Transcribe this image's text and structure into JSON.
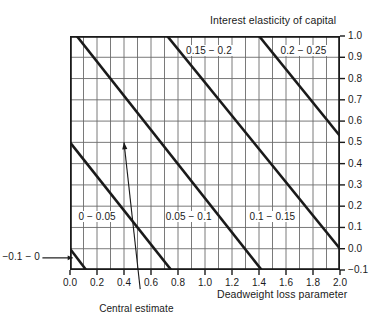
{
  "chart_data": {
    "type": "line",
    "title": "Interest elasticity of capital",
    "xlabel": "Deadweight loss parameter",
    "ylabel": "",
    "xlim": [
      0.0,
      2.0
    ],
    "ylim": [
      -0.1,
      1.0
    ],
    "grid": true,
    "grid_x_step": 0.1,
    "grid_y_step": 0.1,
    "x_ticks": [
      "0.0",
      "0.2",
      "0.4",
      "0.6",
      "0.8",
      "1.0",
      "1.2",
      "1.4",
      "1.6",
      "1.8",
      "2.0"
    ],
    "x_tick_values": [
      0.0,
      0.2,
      0.4,
      0.6,
      0.8,
      1.0,
      1.2,
      1.4,
      1.6,
      1.8,
      2.0
    ],
    "y_ticks": [
      "1.0",
      "0.9",
      "0.8",
      "0.7",
      "0.6",
      "0.5",
      "0.4",
      "0.3",
      "0.2",
      "0.1",
      "0.0",
      "-0.1"
    ],
    "y_tick_values": [
      1.0,
      0.9,
      0.8,
      0.7,
      0.6,
      0.5,
      0.4,
      0.3,
      0.2,
      0.1,
      0.0,
      -0.1
    ],
    "y_axis_position": "right",
    "series": [
      {
        "name": "boundary -0.1 / 0",
        "points": [
          [
            0.0,
            0.0
          ],
          [
            0.12,
            -0.1
          ]
        ]
      },
      {
        "name": "boundary 0 / 0.05",
        "points": [
          [
            0.0,
            0.5
          ],
          [
            0.75,
            -0.1
          ]
        ]
      },
      {
        "name": "boundary 0.05 / 0.1",
        "points": [
          [
            0.05,
            1.0
          ],
          [
            1.42,
            -0.1
          ]
        ]
      },
      {
        "name": "boundary 0.1 / 0.15",
        "points": [
          [
            0.72,
            1.0
          ],
          [
            2.0,
            0.0
          ]
        ]
      },
      {
        "name": "boundary 0.15 / 0.2",
        "points": [
          [
            1.4,
            1.0
          ],
          [
            2.0,
            0.53
          ]
        ]
      }
    ],
    "band_labels": [
      {
        "text": "-0.1 - 0",
        "x": -0.36,
        "y": -0.043,
        "placement": "outside-left",
        "leader": true
      },
      {
        "text": "0 - 0.05",
        "x": 0.2,
        "y": 0.145
      },
      {
        "text": "0.05 - 0.1",
        "x": 0.88,
        "y": 0.145
      },
      {
        "text": "0.1 - 0.15",
        "x": 1.5,
        "y": 0.145
      },
      {
        "text": "0.15 - 0.2",
        "x": 1.03,
        "y": 0.925
      },
      {
        "text": "0.2 - 0.25",
        "x": 1.73,
        "y": 0.925
      }
    ],
    "annotations": [
      {
        "text": "Central estimate",
        "label_x": 0.49,
        "label_y": -0.29,
        "arrow_from": [
          0.52,
          -0.19
        ],
        "arrow_to": [
          0.4,
          0.5
        ]
      }
    ],
    "colors": {
      "line": "#1a1a1a",
      "grid": "#6b6b6b",
      "axis": "#1a1a1a",
      "background": "#ffffff",
      "text": "#1a1a1a"
    }
  }
}
